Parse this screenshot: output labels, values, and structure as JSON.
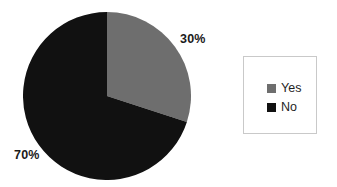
{
  "chart_data": {
    "type": "pie",
    "title": "",
    "categories": [
      "Yes",
      "No"
    ],
    "values": [
      30,
      70
    ],
    "units": "percent",
    "data_labels": [
      "30%",
      "70%"
    ],
    "colors": [
      "#6e6e6e",
      "#111111"
    ],
    "legend_position": "right",
    "grid": false,
    "start_angle_deg": 0,
    "direction": "clockwise",
    "slices": [
      {
        "label": "Yes",
        "value": 30,
        "data_label": "30%",
        "color": "#6e6e6e",
        "start_angle_deg": 0,
        "sweep_deg": 108
      },
      {
        "label": "No",
        "value": 70,
        "data_label": "70%",
        "color": "#111111",
        "start_angle_deg": 108,
        "sweep_deg": 252
      }
    ]
  },
  "chart": {
    "labels": {
      "yes_percent": "30%",
      "no_percent": "70%"
    }
  },
  "legend": {
    "items": [
      {
        "label": "Yes",
        "color": "#6e6e6e"
      },
      {
        "label": "No",
        "color": "#111111"
      }
    ]
  },
  "colors": {
    "yes": "#6e6e6e",
    "no": "#111111",
    "background": "#ffffff",
    "legend_border": "#c9c9c9",
    "text": "#1a1a1a"
  }
}
